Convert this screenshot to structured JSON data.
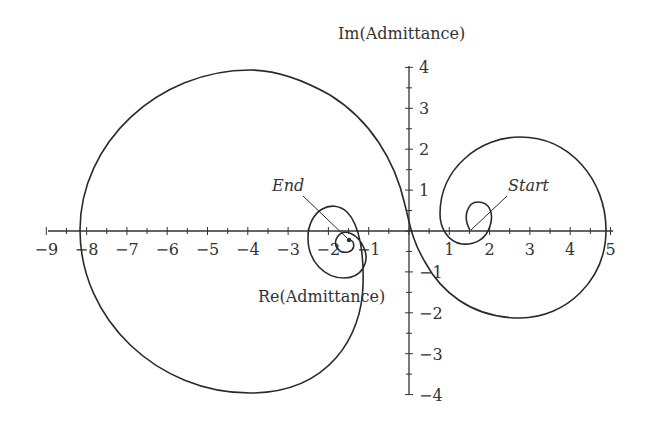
{
  "chart_data": {
    "type": "line",
    "title": "",
    "xlabel": "Re(Admittance)",
    "ylabel": "Im(Admittance)",
    "xlim": [
      -9,
      5
    ],
    "ylim": [
      -4,
      4
    ],
    "x_ticks": [
      "-9",
      "-8",
      "-7",
      "-6",
      "-5",
      "-4",
      "-3",
      "-2",
      "-1",
      "1",
      "2",
      "3",
      "4",
      "5"
    ],
    "y_ticks": [
      "4",
      "3",
      "2",
      "1",
      "-1",
      "-2",
      "-3",
      "-4"
    ],
    "grid": false,
    "annotations": [
      {
        "text": "Start",
        "points_to": [
          1.5,
          0.0
        ]
      },
      {
        "text": "End",
        "points_to": [
          -1.5,
          -0.25
        ]
      }
    ],
    "series": [
      {
        "name": "admittance locus",
        "points": [
          [
            1.5,
            0.0
          ],
          [
            1.3,
            0.35
          ],
          [
            1.6,
            0.65
          ],
          [
            2.0,
            0.5
          ],
          [
            2.0,
            0.0
          ],
          [
            1.6,
            -0.6
          ],
          [
            1.0,
            -0.4
          ],
          [
            0.8,
            0.4
          ],
          [
            1.3,
            1.7
          ],
          [
            2.6,
            2.3
          ],
          [
            4.0,
            1.6
          ],
          [
            4.85,
            0.0
          ],
          [
            4.2,
            -1.5
          ],
          [
            2.6,
            -2.1
          ],
          [
            1.0,
            -1.3
          ],
          [
            0.2,
            0.0
          ],
          [
            -0.3,
            1.2
          ],
          [
            -1.5,
            2.9
          ],
          [
            -4.2,
            3.95
          ],
          [
            -7.2,
            2.8
          ],
          [
            -8.2,
            0.0
          ],
          [
            -7.2,
            -2.8
          ],
          [
            -4.2,
            -4.0
          ],
          [
            -1.8,
            -3.2
          ],
          [
            -1.1,
            -1.0
          ],
          [
            -1.2,
            0.3
          ],
          [
            -1.6,
            0.6
          ],
          [
            -2.4,
            0.0
          ],
          [
            -2.0,
            -1.1
          ],
          [
            -1.2,
            -0.5
          ],
          [
            -1.6,
            0.0
          ],
          [
            -1.8,
            -0.4
          ],
          [
            -1.5,
            -0.25
          ]
        ]
      }
    ]
  },
  "labels": {
    "y_axis_title": "Im(Admittance)",
    "x_axis_title": "Re(Admittance)",
    "start": "Start",
    "end": "End"
  }
}
